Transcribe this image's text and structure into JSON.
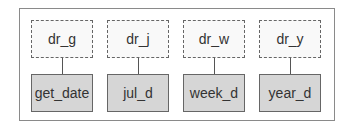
{
  "columns": [
    {
      "top": "dr_g",
      "bottom": "get_date"
    },
    {
      "top": "dr_j",
      "bottom": "jul_d"
    },
    {
      "top": "dr_w",
      "bottom": "week_d"
    },
    {
      "top": "dr_y",
      "bottom": "year_d"
    }
  ],
  "colors": {
    "top_fill": "#f9f9f9",
    "bottom_fill": "#d6d6d6",
    "border": "#666666"
  }
}
